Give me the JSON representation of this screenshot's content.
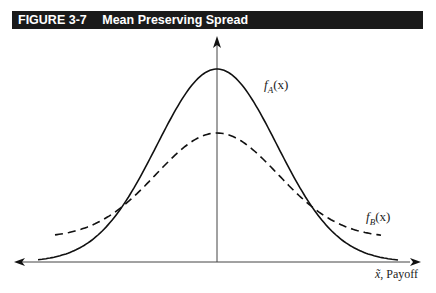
{
  "figure": {
    "number": "FIGURE 3-7",
    "title": "Mean Preserving Spread",
    "header_bg": "#1a1a1a",
    "header_fg": "#ffffff"
  },
  "chart_data": {
    "type": "line",
    "title": "Mean Preserving Spread",
    "xlabel": "x̃, Payoff",
    "ylabel": "",
    "grid": false,
    "legend": "inline labels",
    "series": [
      {
        "name": "f_A(x)",
        "label": "fA(x)",
        "style": "solid",
        "shape": "normal density, narrower/taller",
        "peak_relative": 1.0,
        "spread_relative": 1.0
      },
      {
        "name": "f_B(x)",
        "label": "fB(x)",
        "style": "dashed",
        "shape": "normal density, wider/flatter (same mean)",
        "peak_relative": 0.67,
        "spread_relative": 1.3
      }
    ],
    "annotations": [
      "Curves share the same mean (vertical axis)",
      "Curves cross twice, symmetric about the mean"
    ],
    "axes": {
      "x_arrows": "both directions",
      "y_arrow": "up"
    }
  },
  "labels": {
    "fA_base": "f",
    "fA_sub": "A",
    "fA_arg": "(x)",
    "fB_base": "f",
    "fB_sub": "B",
    "fB_arg": "(x)",
    "xaxis_var": "x̃",
    "xaxis_rest": ", Payoff"
  }
}
